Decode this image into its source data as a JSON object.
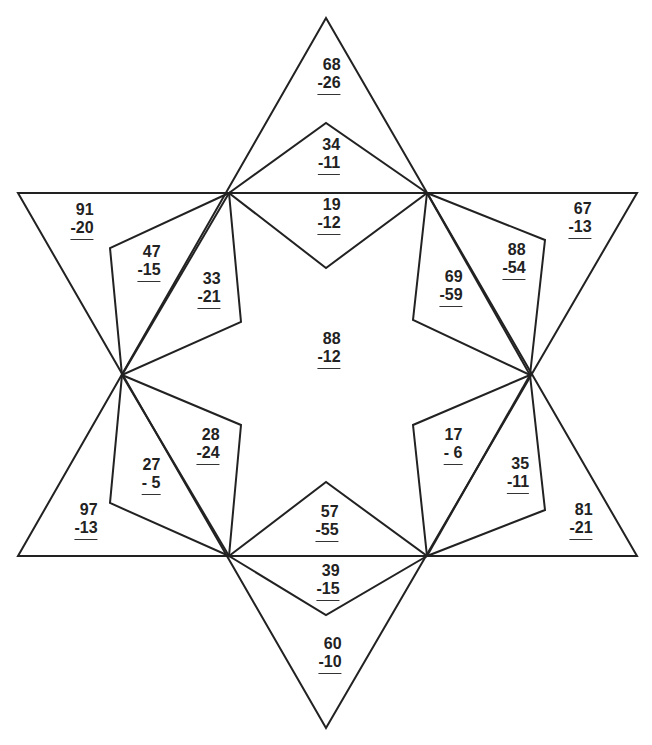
{
  "worksheet": {
    "type": "subtraction-star-puzzle",
    "line_color": "#222222",
    "problems": [
      {
        "region": "top-point",
        "minuend": "68",
        "subtrahend": "-26",
        "x": 329,
        "y": 56
      },
      {
        "region": "top-kite-upper",
        "minuend": "34",
        "subtrahend": "-11",
        "x": 329,
        "y": 136
      },
      {
        "region": "top-kite-lower",
        "minuend": "19",
        "subtrahend": "-12",
        "x": 329,
        "y": 196
      },
      {
        "region": "upper-left-point",
        "minuend": "91",
        "subtrahend": "-20",
        "x": 82,
        "y": 201
      },
      {
        "region": "upper-left-kite-outer",
        "minuend": "47",
        "subtrahend": "-15",
        "x": 149,
        "y": 243
      },
      {
        "region": "upper-left-kite-inner",
        "minuend": "33",
        "subtrahend": "-21",
        "x": 209,
        "y": 270
      },
      {
        "region": "upper-right-point",
        "minuend": "67",
        "subtrahend": "-13",
        "x": 580,
        "y": 200
      },
      {
        "region": "upper-right-kite-outer",
        "minuend": "88",
        "subtrahend": "-54",
        "x": 514,
        "y": 241
      },
      {
        "region": "upper-right-kite-inner",
        "minuend": "69",
        "subtrahend": "-59",
        "x": 451,
        "y": 268
      },
      {
        "region": "center",
        "minuend": "88",
        "subtrahend": "-12",
        "x": 329,
        "y": 330
      },
      {
        "region": "lower-left-kite-inner",
        "minuend": "28",
        "subtrahend": "-24",
        "x": 208,
        "y": 426
      },
      {
        "region": "lower-left-kite-outer",
        "minuend": "27",
        "subtrahend": "- 5",
        "x": 151,
        "y": 456
      },
      {
        "region": "lower-left-point",
        "minuend": "97",
        "subtrahend": "-13",
        "x": 86,
        "y": 501
      },
      {
        "region": "lower-right-kite-inner",
        "minuend": "17",
        "subtrahend": "- 6",
        "x": 453,
        "y": 426
      },
      {
        "region": "lower-right-kite-outer",
        "minuend": "35",
        "subtrahend": "-11",
        "x": 518,
        "y": 455
      },
      {
        "region": "lower-right-point",
        "minuend": "81",
        "subtrahend": "-21",
        "x": 581,
        "y": 501
      },
      {
        "region": "bottom-kite-upper",
        "minuend": "57",
        "subtrahend": "-55",
        "x": 327,
        "y": 503
      },
      {
        "region": "bottom-kite-lower",
        "minuend": "39",
        "subtrahend": "-15",
        "x": 328,
        "y": 562
      },
      {
        "region": "bottom-point",
        "minuend": "60",
        "subtrahend": "-10",
        "x": 330,
        "y": 635
      }
    ]
  }
}
